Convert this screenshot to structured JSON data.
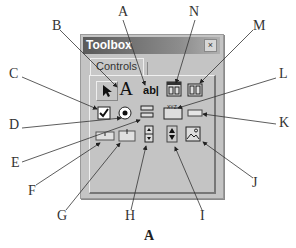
{
  "window": {
    "title": "Toolbox",
    "close_label": "×",
    "tab_label": "Controls"
  },
  "icons": [
    {
      "id": "pointer",
      "name": "pointer-icon",
      "glyph": "↖"
    },
    {
      "id": "label",
      "name": "label-icon",
      "glyph": "A"
    },
    {
      "id": "textbox",
      "name": "textbox-icon",
      "glyph": "ab|"
    },
    {
      "id": "frame",
      "name": "frame-icon"
    },
    {
      "id": "commandbutton",
      "name": "command-button-icon"
    },
    {
      "id": "checkbox",
      "name": "checkbox-icon"
    },
    {
      "id": "optionbutton",
      "name": "option-button-icon"
    },
    {
      "id": "togglebutton",
      "name": "toggle-button-icon"
    },
    {
      "id": "multipage",
      "name": "multipage-icon"
    },
    {
      "id": "tabstrip",
      "name": "tabstrip-icon"
    },
    {
      "id": "listbox",
      "name": "listbox-icon"
    },
    {
      "id": "combobox",
      "name": "combobox-icon"
    },
    {
      "id": "scrollbar",
      "name": "scrollbar-icon"
    },
    {
      "id": "spinbutton",
      "name": "spin-button-icon"
    },
    {
      "id": "image",
      "name": "image-icon"
    }
  ],
  "callouts": {
    "A": "A",
    "B": "B",
    "C": "C",
    "D": "D",
    "E": "E",
    "F": "F",
    "G": "G",
    "H": "H",
    "I": "I",
    "J": "J",
    "K": "K",
    "L": "L",
    "M": "M",
    "N": "N"
  },
  "caption": "A"
}
